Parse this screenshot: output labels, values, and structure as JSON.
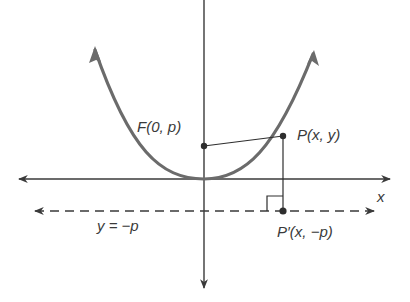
{
  "diagram": {
    "axes": {
      "x_label": "x",
      "y_label": "y"
    },
    "labels": {
      "focus": "F(0, p)",
      "point": "P(x, y)",
      "projection": "P′(x, −p)",
      "directrix": "y = −p"
    },
    "colors": {
      "parabola": "#6b6b6b",
      "axes": "#3a3a3a",
      "dashed_directrix": "#3a3a3a",
      "text": "#3a3a3a",
      "background": "#ffffff"
    }
  }
}
